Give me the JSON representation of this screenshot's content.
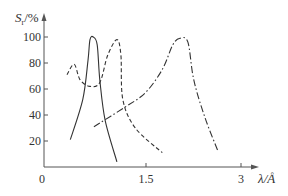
{
  "chart_data": {
    "type": "line",
    "title": "",
    "ylabel": "S_r/%",
    "ylabel_main": "S",
    "ylabel_sub": "r",
    "ylabel_unit": "/%",
    "xlabel": "λ/Å",
    "xlim": [
      0,
      3.4
    ],
    "ylim": [
      0,
      105
    ],
    "x_ticks": [
      0,
      1.5,
      3
    ],
    "x_tick_labels": [
      "0",
      "1.5",
      "3"
    ],
    "y_ticks": [
      20,
      40,
      60,
      80,
      100
    ],
    "y_tick_labels": [
      "20",
      "40",
      "60",
      "80",
      "100"
    ],
    "grid": false,
    "legend": null,
    "series": [
      {
        "name": "solid",
        "style": "solid",
        "x": [
          0.4,
          0.59,
          0.67,
          0.7,
          0.75,
          0.81,
          0.85,
          0.93,
          1.11
        ],
        "y": [
          21,
          52,
          82,
          98,
          100,
          94,
          67,
          36,
          4
        ]
      },
      {
        "name": "dashed",
        "style": "dashed",
        "x": [
          0.35,
          0.46,
          0.55,
          0.7,
          0.85,
          0.97,
          1.11,
          1.17,
          1.2,
          1.39,
          1.8
        ],
        "y": [
          71,
          79,
          67,
          62,
          65,
          86,
          98,
          86,
          52,
          30,
          11
        ]
      },
      {
        "name": "dash-dot",
        "style": "dashdot",
        "x": [
          0.76,
          1.23,
          1.54,
          1.8,
          1.96,
          2.07,
          2.19,
          2.28,
          2.45,
          2.65
        ],
        "y": [
          31,
          46,
          57,
          75,
          94,
          99,
          96,
          67,
          38,
          12
        ]
      }
    ]
  },
  "colors": {
    "axis": "#555555",
    "curve": "#333333",
    "text": "#333333"
  }
}
